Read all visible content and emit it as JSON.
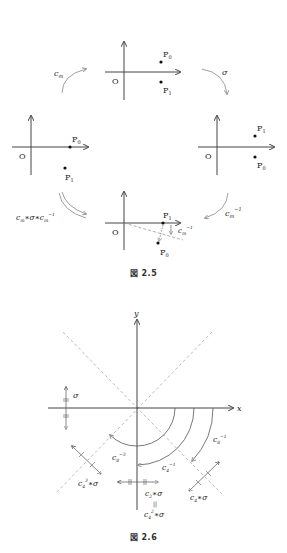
{
  "figure_2_5": {
    "caption": "図 2.5",
    "origin_label": "O",
    "points": {
      "p0": "P",
      "p0_sub": "0",
      "p1": "P",
      "p1_sub": "1"
    },
    "arrows": {
      "top_left": {
        "base": "c",
        "sub": "m"
      },
      "top_right": {
        "base": "σ"
      },
      "bottom_right": {
        "base": "c",
        "sub": "m",
        "sup": "−1"
      },
      "bottom_left": {
        "text": "c",
        "sub": "m",
        "mid": "∗σ∗c",
        "sub2": "m",
        "sup": "−1"
      },
      "bottom_center": {
        "base": "c",
        "sub": "m",
        "sup": "−1"
      }
    }
  },
  "figure_2_6": {
    "caption": "図 2.6",
    "axis_x": "x",
    "axis_y": "y",
    "labels": {
      "sigma": "σ",
      "c8_inv": {
        "base": "c",
        "sub": "8",
        "sup": "−1"
      },
      "c8_inv3": {
        "base": "c",
        "sub": "8",
        "sup": "−3"
      },
      "c4_inv": {
        "base": "c",
        "sub": "4",
        "sup": "−1"
      },
      "c4_sigma": {
        "base": "c",
        "sub": "4",
        "rest": "∗σ"
      },
      "c43_sigma": {
        "base": "c",
        "sub": "4",
        "sup": "3",
        "rest": "∗σ"
      },
      "c2_sigma": {
        "base": "c",
        "sub": "2",
        "rest": "∗σ"
      },
      "equals": "||",
      "c42_sigma": {
        "base": "c",
        "sub": "4",
        "sup": "2",
        "rest": "∗σ"
      }
    }
  }
}
